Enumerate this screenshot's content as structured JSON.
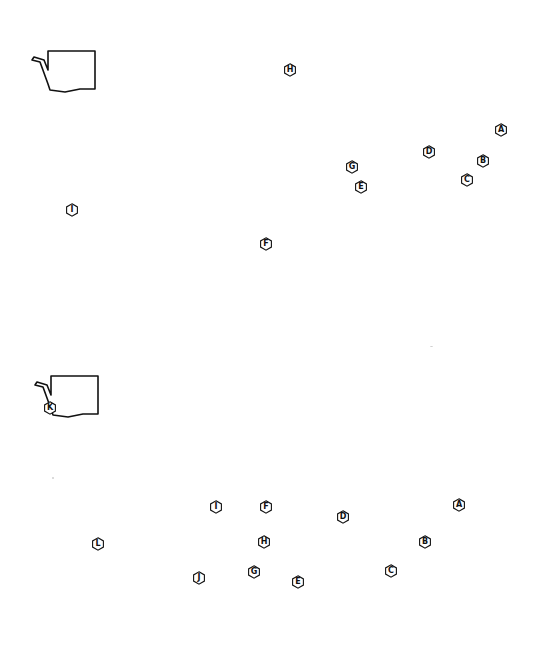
{
  "figure": {
    "colors": {
      "background": "#ffffff",
      "line": "#111111"
    }
  },
  "maps": [
    {
      "id": "top-map",
      "markers": [
        {
          "label": "A",
          "x": 501,
          "y": 130
        },
        {
          "label": "B",
          "x": 483,
          "y": 161
        },
        {
          "label": "C",
          "x": 467,
          "y": 180
        },
        {
          "label": "D",
          "x": 429,
          "y": 152
        },
        {
          "label": "E",
          "x": 361,
          "y": 187
        },
        {
          "label": "F",
          "x": 266,
          "y": 244
        },
        {
          "label": "G",
          "x": 352,
          "y": 167
        },
        {
          "label": "H",
          "x": 290,
          "y": 70
        },
        {
          "label": "I",
          "x": 72,
          "y": 210
        }
      ]
    },
    {
      "id": "bottom-map",
      "markers": [
        {
          "label": "A",
          "x": 459,
          "y": 505
        },
        {
          "label": "B",
          "x": 425,
          "y": 542
        },
        {
          "label": "C",
          "x": 391,
          "y": 571
        },
        {
          "label": "D",
          "x": 343,
          "y": 517
        },
        {
          "label": "E",
          "x": 298,
          "y": 582
        },
        {
          "label": "F",
          "x": 266,
          "y": 507
        },
        {
          "label": "G",
          "x": 254,
          "y": 572
        },
        {
          "label": "H",
          "x": 264,
          "y": 542
        },
        {
          "label": "I",
          "x": 216,
          "y": 507
        },
        {
          "label": "J",
          "x": 199,
          "y": 578
        },
        {
          "label": "K",
          "x": 50,
          "y": 408
        },
        {
          "label": "L",
          "x": 98,
          "y": 544
        }
      ]
    }
  ]
}
